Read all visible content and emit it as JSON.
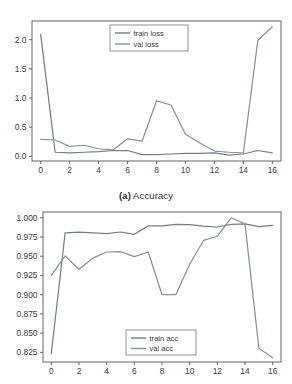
{
  "figure": {
    "caption_marker": "(a)",
    "caption_text": " Accuracy"
  },
  "colors": {
    "train": "#6f7f8c",
    "val": "#8a9298",
    "axis": "#555555",
    "text": "#3a3a3a",
    "background": "#ffffff"
  },
  "chart_data": [
    {
      "type": "line",
      "id": "loss",
      "title": "",
      "xlabel": "",
      "ylabel": "",
      "xlim": [
        -0.6,
        16.6
      ],
      "ylim": [
        -0.08,
        2.32
      ],
      "xticks": [
        0,
        2,
        4,
        6,
        8,
        10,
        12,
        14,
        16
      ],
      "xticklabels": [
        "0",
        "2",
        "4",
        "6",
        "8",
        "10",
        "12",
        "14",
        "16"
      ],
      "yticks": [
        0.0,
        0.5,
        1.0,
        1.5,
        2.0
      ],
      "yticklabels": [
        "0.0",
        "0.5",
        "1.0",
        "1.5",
        "2.0"
      ],
      "grid": false,
      "legend_position": "upper center",
      "x": [
        0,
        1,
        2,
        3,
        4,
        5,
        6,
        7,
        8,
        9,
        10,
        11,
        12,
        13,
        14,
        15,
        16
      ],
      "series": [
        {
          "name": "train loss",
          "values": [
            2.09,
            0.07,
            0.06,
            0.07,
            0.08,
            0.1,
            0.1,
            0.03,
            0.03,
            0.04,
            0.05,
            0.05,
            0.06,
            0.02,
            0.04,
            0.1,
            0.06
          ]
        },
        {
          "name": "val loss",
          "values": [
            0.29,
            0.28,
            0.17,
            0.19,
            0.13,
            0.11,
            0.3,
            0.26,
            0.95,
            0.88,
            0.38,
            0.23,
            0.09,
            0.07,
            0.06,
            1.99,
            2.22
          ]
        }
      ]
    },
    {
      "type": "line",
      "id": "accuracy",
      "title": "",
      "xlabel": "",
      "ylabel": "",
      "xlim": [
        -0.6,
        16.6
      ],
      "ylim": [
        0.8125,
        1.0075
      ],
      "xticks": [
        0,
        2,
        4,
        6,
        8,
        10,
        12,
        14,
        16
      ],
      "xticklabels": [
        "0",
        "2",
        "4",
        "6",
        "8",
        "10",
        "12",
        "14",
        "16"
      ],
      "yticks": [
        0.825,
        0.85,
        0.875,
        0.9,
        0.925,
        0.95,
        0.975,
        1.0
      ],
      "yticklabels": [
        "0.825",
        "0.850",
        "0.875",
        "0.900",
        "0.925",
        "0.950",
        "0.975",
        "1.000"
      ],
      "grid": false,
      "legend_position": "lower center",
      "x": [
        0,
        1,
        2,
        3,
        4,
        5,
        6,
        7,
        8,
        9,
        10,
        11,
        12,
        13,
        14,
        15,
        16
      ],
      "series": [
        {
          "name": "train acc",
          "values": [
            0.8235,
            0.9805,
            0.9812,
            0.9805,
            0.9795,
            0.9815,
            0.9785,
            0.9895,
            0.9895,
            0.9915,
            0.991,
            0.989,
            0.988,
            0.9915,
            0.992,
            0.9885,
            0.99
          ]
        },
        {
          "name": "val acc",
          "values": [
            0.925,
            0.9505,
            0.933,
            0.9475,
            0.9555,
            0.956,
            0.9495,
            0.9555,
            0.9002,
            0.9,
            0.9395,
            0.9705,
            0.976,
            1.0,
            0.992,
            0.8305,
            0.818
          ]
        }
      ]
    }
  ]
}
